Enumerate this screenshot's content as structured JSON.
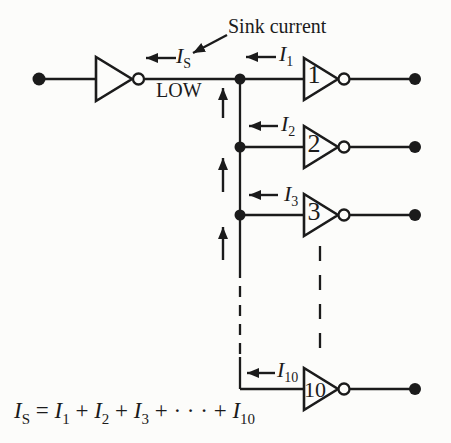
{
  "figure": {
    "annotation": "Sink current",
    "line_state": "LOW",
    "colors": {
      "ink": "#1b1b1b",
      "paper": "#fcfcfa"
    },
    "currents": {
      "sink": {
        "base": "I",
        "sub": "S"
      },
      "i1": {
        "base": "I",
        "sub": "1"
      },
      "i2": {
        "base": "I",
        "sub": "2"
      },
      "i3": {
        "base": "I",
        "sub": "3"
      },
      "i10": {
        "base": "I",
        "sub": "10"
      }
    },
    "gates": {
      "loads": [
        {
          "number": "1"
        },
        {
          "number": "2"
        },
        {
          "number": "3"
        },
        {
          "number": "10"
        }
      ]
    },
    "equation": {
      "parts": [
        {
          "t": "I",
          "k": "var"
        },
        {
          "t": "S",
          "k": "sub"
        },
        {
          "t": " = ",
          "k": "op"
        },
        {
          "t": "I",
          "k": "var"
        },
        {
          "t": "1",
          "k": "sub"
        },
        {
          "t": " + ",
          "k": "op"
        },
        {
          "t": "I",
          "k": "var"
        },
        {
          "t": "2",
          "k": "sub"
        },
        {
          "t": " + ",
          "k": "op"
        },
        {
          "t": "I",
          "k": "var"
        },
        {
          "t": "3",
          "k": "sub"
        },
        {
          "t": " + · · · + ",
          "k": "op"
        },
        {
          "t": "I",
          "k": "var"
        },
        {
          "t": "10",
          "k": "sub"
        }
      ]
    }
  }
}
